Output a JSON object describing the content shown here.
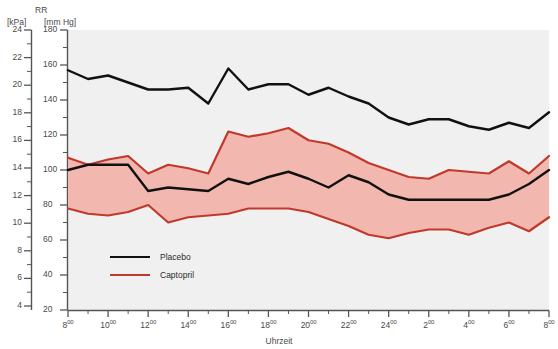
{
  "axes": {
    "left_unit": "[kPa]",
    "right_unit": "[mm Hg]",
    "right_title": "RR",
    "x_title": "Uhrzeit",
    "kpa_ticks": [
      24,
      22,
      20,
      18,
      16,
      14,
      12,
      10,
      8,
      6,
      4
    ],
    "mmhg_ticks": [
      180,
      160,
      140,
      120,
      100,
      80,
      60,
      40,
      20
    ],
    "mmhg_range": [
      20,
      180
    ],
    "x_tick_labels": [
      "8",
      "10",
      "12",
      "14",
      "16",
      "18",
      "20",
      "22",
      "24",
      "2",
      "4",
      "6",
      "8"
    ],
    "x_tick_superscript": "00",
    "x_range_hours": [
      8,
      32
    ]
  },
  "legend": {
    "position": "inside-lower-left",
    "items": [
      {
        "label": "Placebo",
        "color": "#111111"
      },
      {
        "label": "Captopril",
        "color": "#c0392b"
      }
    ]
  },
  "colors": {
    "placebo_line": "#111111",
    "captopril_line": "#c0392b",
    "captopril_band_fill": "#f2b8b0",
    "plot_background": "#f0f0f0",
    "axis": "#555555",
    "text": "#4a4a4a"
  },
  "caption": "",
  "chart_data": {
    "type": "line",
    "title": "",
    "subtitle": "",
    "xlabel": "Uhrzeit",
    "ylabel": "RR [mm Hg]",
    "ylabel_secondary": "[kPa]",
    "ylim": [
      20,
      180
    ],
    "xlim": [
      8,
      32
    ],
    "grid": false,
    "legend_position": "inside-lower-left",
    "annotations": [],
    "x": [
      8,
      9,
      10,
      11,
      12,
      13,
      14,
      15,
      16,
      17,
      18,
      19,
      20,
      21,
      22,
      23,
      24,
      25,
      26,
      27,
      28,
      29,
      30,
      31,
      32
    ],
    "x_tick_labels": [
      "8:00",
      "10:00",
      "12:00",
      "14:00",
      "16:00",
      "18:00",
      "20:00",
      "22:00",
      "24:00",
      "2:00",
      "4:00",
      "6:00",
      "8:00"
    ],
    "series": [
      {
        "name": "Placebo systolic",
        "color": "#111111",
        "unit": "mm Hg",
        "values": [
          157,
          152,
          154,
          150,
          146,
          146,
          147,
          138,
          158,
          146,
          149,
          149,
          143,
          147,
          142,
          138,
          130,
          126,
          129,
          129,
          125,
          123,
          127,
          124,
          133
        ]
      },
      {
        "name": "Placebo diastolic",
        "color": "#111111",
        "unit": "mm Hg",
        "values": [
          100,
          103,
          103,
          103,
          88,
          90,
          89,
          88,
          95,
          92,
          96,
          99,
          95,
          90,
          97,
          93,
          86,
          83,
          83,
          83,
          83,
          83,
          86,
          92,
          100
        ]
      },
      {
        "name": "Captopril systolic upper",
        "color": "#c0392b",
        "unit": "mm Hg",
        "values": [
          107,
          103,
          106,
          108,
          98,
          103,
          101,
          98,
          122,
          119,
          121,
          124,
          117,
          115,
          110,
          104,
          100,
          96,
          95,
          100,
          99,
          98,
          105,
          98,
          108
        ]
      },
      {
        "name": "Captopril diastolic lower",
        "color": "#c0392b",
        "unit": "mm Hg",
        "values": [
          78,
          75,
          74,
          76,
          80,
          70,
          73,
          74,
          75,
          78,
          78,
          78,
          76,
          72,
          68,
          63,
          61,
          64,
          66,
          66,
          63,
          67,
          70,
          65,
          73
        ]
      }
    ]
  }
}
